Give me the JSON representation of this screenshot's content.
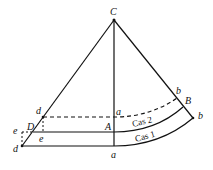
{
  "diagram": {
    "labels": {
      "apex": "C",
      "top_left": "d",
      "top_mid": "a",
      "top_right": "b",
      "mid_left": "D",
      "mid_mid": "A",
      "mid_right": "B",
      "far_left": "e",
      "inner_left": "e",
      "bottom_left": "d",
      "bottom_mid": "a",
      "bottom_right": "b"
    },
    "bands": {
      "upper": "Cas 2",
      "lower": "Cas 1"
    }
  }
}
